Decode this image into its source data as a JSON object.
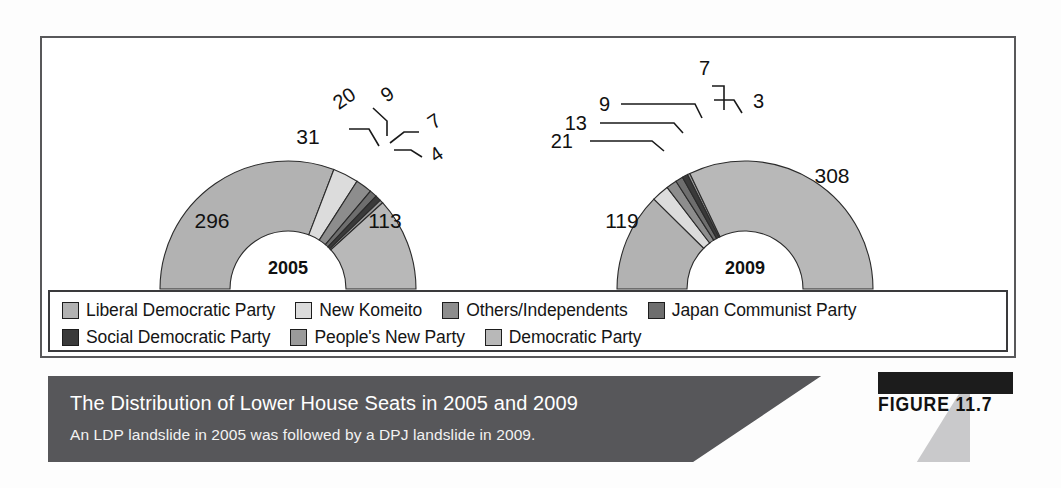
{
  "figure": {
    "number_label": "FIGURE 11.7",
    "title": "The Distribution of Lower House Seats in 2005 and 2009",
    "subtitle": "An LDP landslide in 2005 was followed by a DPJ landslide in 2009."
  },
  "legend": {
    "rows": [
      [
        {
          "label": "Liberal Democratic Party",
          "color": "#b2b2b2"
        },
        {
          "label": "New Komeito",
          "color": "#dcdcdc"
        },
        {
          "label": "Others/Independents",
          "color": "#8d8d8d"
        },
        {
          "label": "Japan Communist Party",
          "color": "#6e6e6e"
        }
      ],
      [
        {
          "label": "Social Democratic Party",
          "color": "#3a3a3a"
        },
        {
          "label": "People's New Party",
          "color": "#9b9b9b"
        },
        {
          "label": "Democratic Party",
          "color": "#b8b8b8"
        }
      ]
    ]
  },
  "chart_data": {
    "type": "pie",
    "title": "The Distribution of Lower House Seats in 2005 and 2009",
    "subtitle": "An LDP landslide in 2005 was followed by a DPJ landslide in 2009.",
    "variant": "half-donut",
    "legend_position": "bottom",
    "series_labels": [
      "Liberal Democratic Party",
      "New Komeito",
      "Others/Independents",
      "Japan Communist Party",
      "Social Democratic Party",
      "People's New Party",
      "Democratic Party"
    ],
    "charts": [
      {
        "center_label": "2005",
        "total": 480,
        "categories": [
          "Liberal Democratic Party",
          "New Komeito",
          "Others/Independents",
          "Japan Communist Party",
          "Social Democratic Party",
          "People's New Party",
          "Democratic Party"
        ],
        "values": [
          296,
          31,
          20,
          9,
          7,
          4,
          113
        ],
        "colors": [
          "#b2b2b2",
          "#dcdcdc",
          "#8d8d8d",
          "#6e6e6e",
          "#3a3a3a",
          "#9b9b9b",
          "#b8b8b8"
        ],
        "labels_inside": [
          "296",
          "31",
          "",
          "",
          "",
          "",
          "113"
        ],
        "labels_leadered": [
          "20",
          "9",
          "7",
          "4"
        ]
      },
      {
        "center_label": "2009",
        "total": 480,
        "categories": [
          "Liberal Democratic Party",
          "New Komeito",
          "Others/Independents",
          "Japan Communist Party",
          "Social Democratic Party",
          "People's New Party",
          "Democratic Party"
        ],
        "values": [
          119,
          21,
          13,
          9,
          7,
          3,
          308
        ],
        "colors": [
          "#b2b2b2",
          "#dcdcdc",
          "#8d8d8d",
          "#6e6e6e",
          "#3a3a3a",
          "#9b9b9b",
          "#b8b8b8"
        ],
        "labels_inside": [
          "119",
          "",
          "",
          "",
          "",
          "",
          "308"
        ],
        "labels_leadered": [
          "21",
          "13",
          "9",
          "7",
          "3"
        ]
      }
    ]
  },
  "values": {
    "y2005": {
      "ldp": "296",
      "komeito": "31",
      "others": "20",
      "jcp": "9",
      "sdp": "7",
      "pnp": "4",
      "dpj": "113",
      "year": "2005"
    },
    "y2009": {
      "ldp": "119",
      "komeito": "21",
      "others": "13",
      "jcp": "9",
      "sdp": "7",
      "pnp": "3",
      "dpj": "308",
      "year": "2009"
    }
  }
}
